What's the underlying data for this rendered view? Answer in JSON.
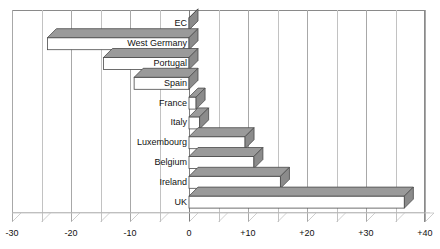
{
  "corner_note": "",
  "chart_data": {
    "type": "bar",
    "orientation": "horizontal",
    "style": "3d-isometric",
    "title": "",
    "subtitle": "",
    "xlabel": "",
    "ylabel": "",
    "xlim": [
      -30,
      40
    ],
    "ylim": null,
    "grid": true,
    "grid_axis": "x",
    "legend": false,
    "legend_position": "none",
    "categories": [
      "EC",
      "West Germany",
      "Portugal",
      "Spain",
      "France",
      "Italy",
      "Luxembourg",
      "Belgium",
      "Ireland",
      "UK"
    ],
    "values": [
      0,
      -24,
      -14.5,
      -9.3,
      1.2,
      1.8,
      9.5,
      11,
      15.5,
      36.5
    ],
    "xticks": [
      -30,
      -25,
      -20,
      -15,
      -10,
      -5,
      0,
      5,
      10,
      15,
      20,
      25,
      30,
      35,
      40
    ],
    "xtick_labels_major": {
      "-30": "-30",
      "-20": "-20",
      "-10": "-10",
      "0": "0",
      "10": "+10",
      "20": "+20",
      "30": "+30",
      "40": "+40"
    },
    "colors": {
      "bar_front": "#ffffff",
      "bar_top": "#9a9a9a",
      "bar_side": "#8b8b8b",
      "bar_outline": "#4a4a4a",
      "grid": "#c2c2c2",
      "grid_major": "#a8a8a8",
      "axis": "#7d7d7d",
      "text": "#111111",
      "background": "#ffffff"
    }
  },
  "axis": {
    "tick_labels": [
      "-30",
      "-20",
      "-10",
      "0",
      "+10",
      "+20",
      "+30",
      "+40"
    ],
    "tick_values": [
      -30,
      -20,
      -10,
      0,
      10,
      20,
      30,
      40
    ]
  },
  "categories_display": [
    "EC",
    "West Germany",
    "Portugal",
    "Spain",
    "France",
    "Italy",
    "Luxembourg",
    "Belgium",
    "Ireland",
    "UK"
  ]
}
